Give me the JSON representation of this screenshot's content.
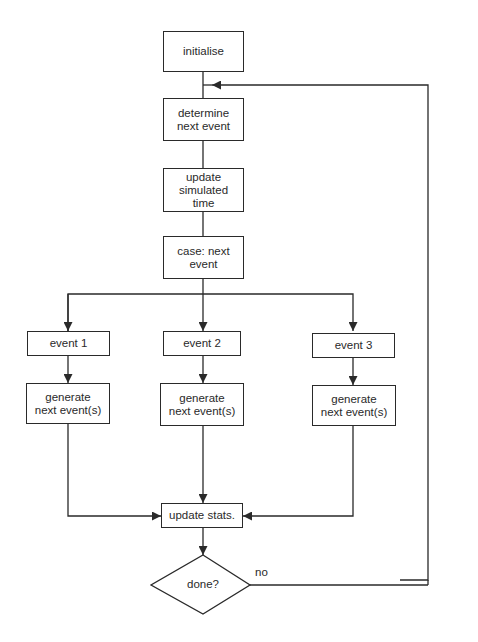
{
  "diagram": {
    "type": "flowchart",
    "title": "",
    "nodes": {
      "initialise": {
        "label": "initialise",
        "shape": "rect"
      },
      "determine": {
        "label": "determine\nnext event",
        "shape": "rect"
      },
      "update_time": {
        "label": "update\nsimulated\ntime",
        "shape": "rect"
      },
      "case": {
        "label": "case: next\nevent",
        "shape": "rect"
      },
      "event1": {
        "label": "event 1",
        "shape": "rect"
      },
      "event2": {
        "label": "event 2",
        "shape": "rect"
      },
      "event3": {
        "label": "event 3",
        "shape": "rect"
      },
      "gen1": {
        "label": "generate\nnext event(s)",
        "shape": "rect"
      },
      "gen2": {
        "label": "generate\nnext event(s)",
        "shape": "rect"
      },
      "gen3": {
        "label": "generate\nnext event(s)",
        "shape": "rect"
      },
      "update_stats": {
        "label": "update stats.",
        "shape": "rect"
      },
      "done": {
        "label": "done?",
        "shape": "diamond"
      }
    },
    "edges": [
      {
        "from": "initialise",
        "to": "determine"
      },
      {
        "from": "determine",
        "to": "update_time"
      },
      {
        "from": "update_time",
        "to": "case"
      },
      {
        "from": "case",
        "to": "event1"
      },
      {
        "from": "case",
        "to": "event2"
      },
      {
        "from": "case",
        "to": "event3"
      },
      {
        "from": "event1",
        "to": "gen1"
      },
      {
        "from": "event2",
        "to": "gen2"
      },
      {
        "from": "event3",
        "to": "gen3"
      },
      {
        "from": "gen1",
        "to": "update_stats"
      },
      {
        "from": "gen2",
        "to": "update_stats"
      },
      {
        "from": "gen3",
        "to": "update_stats"
      },
      {
        "from": "update_stats",
        "to": "done"
      },
      {
        "from": "done",
        "to": "determine",
        "label": "no"
      }
    ],
    "edge_labels": {
      "no": "no"
    },
    "colors": {
      "stroke": "#2a2a2a",
      "background": "#ffffff"
    }
  }
}
